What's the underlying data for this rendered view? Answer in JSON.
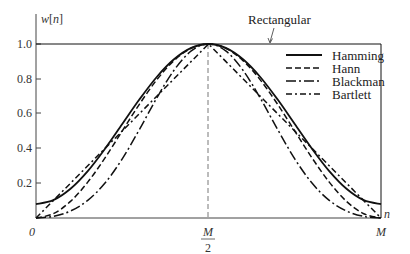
{
  "chart_data": {
    "type": "line",
    "title": "",
    "xlabel": "n",
    "ylabel": "w[n]",
    "ylim": [
      0,
      1.0
    ],
    "xlim": [
      0,
      1
    ],
    "grid": false,
    "legend_position": "upper right",
    "y_ticks": [
      "1.0",
      "0.8",
      "0.6",
      "0.4",
      "0.2"
    ],
    "y_tick_values": [
      1.0,
      0.8,
      0.6,
      0.4,
      0.2
    ],
    "x_ticks": [
      {
        "pos": 0,
        "label": "0"
      },
      {
        "pos": 0.5,
        "label": "M/2",
        "num": "M",
        "den": "2"
      },
      {
        "pos": 1,
        "label": "M"
      }
    ],
    "annotation": {
      "text": "Rectangular",
      "target": "top line w[n]=1"
    },
    "x": [
      0,
      0.05,
      0.1,
      0.15,
      0.2,
      0.25,
      0.3,
      0.35,
      0.4,
      0.45,
      0.5,
      0.55,
      0.6,
      0.65,
      0.7,
      0.75,
      0.8,
      0.85,
      0.9,
      0.95,
      1
    ],
    "series": [
      {
        "name": "Rectangular",
        "style": "solid-thin",
        "values": [
          1,
          1,
          1,
          1,
          1,
          1,
          1,
          1,
          1,
          1,
          1,
          1,
          1,
          1,
          1,
          1,
          1,
          1,
          1,
          1,
          1
        ]
      },
      {
        "name": "Hamming",
        "style": "solid",
        "values": [
          0.08,
          0.1025,
          0.168,
          0.2695,
          0.398,
          0.54,
          0.682,
          0.8105,
          0.912,
          0.9775,
          1,
          0.9775,
          0.912,
          0.8105,
          0.682,
          0.54,
          0.398,
          0.2695,
          0.168,
          0.1025,
          0.08
        ]
      },
      {
        "name": "Hann",
        "style": "dashed",
        "values": [
          0,
          0.0245,
          0.0955,
          0.2061,
          0.3455,
          0.5,
          0.6545,
          0.7939,
          0.9045,
          0.9755,
          1,
          0.9755,
          0.9045,
          0.7939,
          0.6545,
          0.5,
          0.3455,
          0.2061,
          0.0955,
          0.0245,
          0
        ]
      },
      {
        "name": "Blackman",
        "style": "long-dash-dot",
        "values": [
          0,
          0.0092,
          0.0402,
          0.1013,
          0.2008,
          0.34,
          0.5098,
          0.6893,
          0.8492,
          0.9602,
          1,
          0.9602,
          0.8492,
          0.6893,
          0.5098,
          0.34,
          0.2008,
          0.1013,
          0.0402,
          0.0092,
          0
        ]
      },
      {
        "name": "Bartlett",
        "style": "dash-dot",
        "values": [
          0,
          0.1,
          0.2,
          0.3,
          0.4,
          0.5,
          0.6,
          0.7,
          0.8,
          0.9,
          1,
          0.9,
          0.8,
          0.7,
          0.6,
          0.5,
          0.4,
          0.3,
          0.2,
          0.1,
          0
        ]
      }
    ]
  },
  "legend": {
    "items": [
      {
        "label": "Hamming"
      },
      {
        "label": "Hann"
      },
      {
        "label": "Blackman"
      },
      {
        "label": "Bartlett"
      }
    ]
  },
  "axis": {
    "ylabel_w": "w",
    "ylabel_n": "n",
    "xlabel": "n",
    "origin": "0",
    "mid_num": "M",
    "mid_den": "2",
    "end": "M"
  },
  "annotation_label": "Rectangular"
}
